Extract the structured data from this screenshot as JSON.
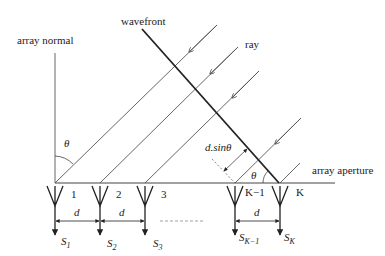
{
  "diagram": {
    "labels": {
      "array_normal": "array normal",
      "wavefront": "wavefront",
      "ray": "ray",
      "array_aperture": "array aperture",
      "theta_normal": "θ",
      "theta_aperture": "θ",
      "path_difference": "d.sinθ",
      "spacing": "d"
    },
    "elements": [
      {
        "index_label": "1",
        "signal": "S",
        "sub": "1"
      },
      {
        "index_label": "2",
        "signal": "S",
        "sub": "2"
      },
      {
        "index_label": "3",
        "signal": "S",
        "sub": "3"
      },
      {
        "index_label": "K−1",
        "signal": "S",
        "sub": "K−1"
      },
      {
        "index_label": "K",
        "signal": "S",
        "sub": "K"
      }
    ],
    "spacing_labels": [
      "d",
      "d",
      "d"
    ],
    "colors": {
      "line": "#333333",
      "thin_line": "#555555",
      "dashed": "#888888",
      "text": "#222222"
    }
  }
}
